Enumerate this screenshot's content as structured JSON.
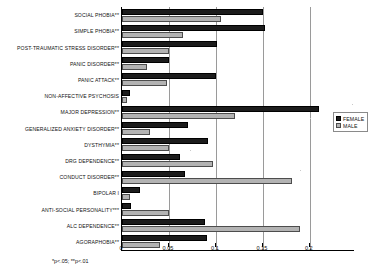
{
  "chart_data": {
    "type": "bar",
    "orientation": "horizontal",
    "title": "",
    "xlabel": "",
    "ylabel": "",
    "xlim": [
      0,
      0.247
    ],
    "xticks": [
      0,
      0.05,
      0.1,
      0.15,
      0.2
    ],
    "xticklabels": [
      "0",
      "0.05",
      "0.1",
      "0.15",
      "0.2"
    ],
    "grid": "vertical",
    "legend_position": "right",
    "categories": [
      "SOCIAL PHOBIA**",
      "SIMPLE PHOBIA**",
      "POST-TRAUMATIC STRESS DISORDER**",
      "PANIC DISORDER**",
      "PANIC ATTACK**",
      "NON-AFFECTIVE PSYCHOSIS",
      "MAJOR DEPRESSION**",
      "GENERALIZED ANXIETY DISORDER**",
      "DYSTHYMIA**",
      "DRG DEPENDENCE**",
      "CONDUCT DISORDER**",
      "BIPOLAR I",
      "ANTI-SOCIAL PERSONALITY***",
      "ALC DEPENDENCE**",
      "AGORAPHOBIA**"
    ],
    "series": [
      {
        "name": "FEMALE",
        "color": "#1c1c1c",
        "values": [
          0.15,
          0.152,
          0.101,
          0.05,
          0.1,
          0.008,
          0.21,
          0.07,
          0.092,
          0.062,
          0.067,
          0.019,
          0.01,
          0.088,
          0.091
        ]
      },
      {
        "name": "MALE",
        "color": "#b3b3b3",
        "values": [
          0.105,
          0.065,
          0.05,
          0.027,
          0.048,
          0.005,
          0.12,
          0.03,
          0.05,
          0.097,
          0.181,
          0.009,
          0.05,
          0.189,
          0.04
        ]
      }
    ]
  },
  "legend": {
    "items": [
      {
        "label": "FEMALE",
        "swatch": "female"
      },
      {
        "label": "MALE",
        "swatch": "male"
      }
    ]
  },
  "footnote": {
    "text": "*p<.05; **p<.01"
  }
}
